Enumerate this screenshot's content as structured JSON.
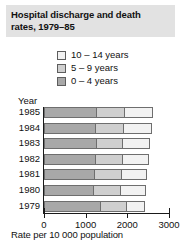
{
  "title": {
    "line1": "Hospital discharge and death",
    "line2": "rates, 1979–85"
  },
  "legend": {
    "position": "top-center",
    "items": [
      {
        "label": "10 – 14 years",
        "color": "#f2f2f2"
      },
      {
        "label": "5 – 9 years",
        "color": "#cfcfcf"
      },
      {
        "label": "0 – 4 years",
        "color": "#a8a8a8"
      }
    ]
  },
  "axes": {
    "year_header": "Year",
    "xlabel": "Rate per 10 000 population",
    "xticks": [
      "0",
      "1000",
      "2000",
      "3000"
    ],
    "xtick_values": [
      0,
      1000,
      2000,
      3000
    ]
  },
  "colors": {
    "title_band": "#e2e2e2",
    "axis": "#1a1a1a",
    "segment_border": "#6e6e6e",
    "series_0_4": "#a8a8a8",
    "series_5_9": "#cfcfcf",
    "series_10_14": "#f2f2f2"
  },
  "chart_data": {
    "type": "bar",
    "orientation": "horizontal",
    "stacked": true,
    "title": "Hospital discharge and death rates, 1979–85",
    "xlabel": "Rate per 10 000 population",
    "ylabel": "Year",
    "xlim": [
      0,
      3000
    ],
    "grid": false,
    "legend_position": "top-center",
    "categories": [
      "1985",
      "1984",
      "1983",
      "1982",
      "1981",
      "1980",
      "1979"
    ],
    "series": [
      {
        "name": "0 – 4 years",
        "color": "#a8a8a8",
        "values": [
          1250,
          1230,
          1250,
          1220,
          1200,
          1180,
          1350
        ]
      },
      {
        "name": "5 – 9 years",
        "color": "#cfcfcf",
        "values": [
          670,
          670,
          620,
          650,
          640,
          640,
          620
        ]
      },
      {
        "name": "10 – 14 years",
        "color": "#f2f2f2",
        "values": [
          670,
          660,
          650,
          630,
          610,
          600,
          430
        ]
      }
    ],
    "totals": [
      2590,
      2560,
      2520,
      2500,
      2450,
      2420,
      2400
    ]
  }
}
